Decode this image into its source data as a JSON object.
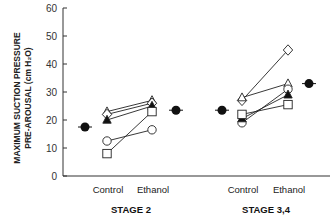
{
  "chart_data": {
    "type": "scatter",
    "title": "",
    "ylabel_line1": "MAXIMUM SUCTION PRESSURE",
    "ylabel_line2": "PRE-AROUSAL  (cm H₂O)",
    "ylim": [
      0,
      60
    ],
    "yticks": [
      0,
      10,
      20,
      30,
      40,
      50,
      60
    ],
    "grid": false,
    "legend": null,
    "groups": [
      {
        "name": "STAGE 2",
        "categories": [
          "Control",
          "Ethanol"
        ],
        "mean_control": 17.5,
        "mean_ethanol": 23.5,
        "subjects": [
          {
            "marker": "open-triangle",
            "values": [
              23,
              27
            ]
          },
          {
            "marker": "open-diamond",
            "values": [
              22,
              26
            ]
          },
          {
            "marker": "filled-triangle",
            "values": [
              20,
              25
            ]
          },
          {
            "marker": "open-circle",
            "values": [
              12.5,
              16.5
            ]
          },
          {
            "marker": "open-square",
            "values": [
              8,
              23
            ]
          }
        ]
      },
      {
        "name": "STAGE 3,4",
        "categories": [
          "Control",
          "Ethanol"
        ],
        "mean_control": 23.5,
        "mean_ethanol": 33,
        "subjects": [
          {
            "marker": "open-diamond",
            "values": [
              27,
              45
            ]
          },
          {
            "marker": "open-triangle",
            "values": [
              28,
              33
            ]
          },
          {
            "marker": "open-circle",
            "values": [
              19,
              31
            ]
          },
          {
            "marker": "filled-triangle",
            "values": [
              20.5,
              29
            ]
          },
          {
            "marker": "open-square",
            "values": [
              22,
              25.5
            ]
          }
        ]
      }
    ]
  }
}
